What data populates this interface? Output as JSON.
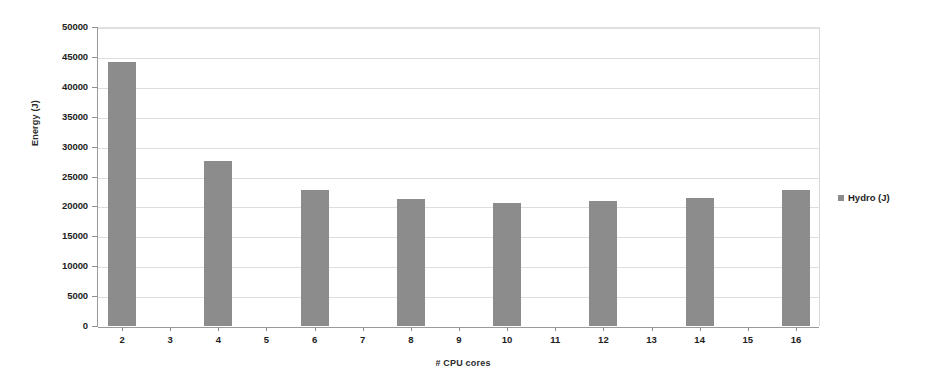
{
  "chart_data": {
    "type": "bar",
    "title": "",
    "xlabel": "# CPU cores",
    "ylabel": "Energy (J)",
    "categories": [
      "2",
      "3",
      "4",
      "5",
      "6",
      "7",
      "8",
      "9",
      "10",
      "11",
      "12",
      "13",
      "14",
      "15",
      "16"
    ],
    "values": [
      44200,
      null,
      27600,
      null,
      22700,
      null,
      21200,
      null,
      20500,
      null,
      20900,
      null,
      21400,
      null,
      22700
    ],
    "series": [
      {
        "name": "Hydro (J)",
        "color": "#8c8c8c",
        "values": [
          44200,
          null,
          27600,
          null,
          22700,
          null,
          21200,
          null,
          20500,
          null,
          20900,
          null,
          21400,
          null,
          22700
        ]
      }
    ],
    "ylim": [
      0,
      50000
    ],
    "ytick_labels": [
      "50000",
      "45000",
      "40000",
      "35000",
      "30000",
      "25000",
      "20000",
      "15000",
      "10000",
      "5000",
      "0"
    ],
    "ytick_values": [
      50000,
      45000,
      40000,
      35000,
      30000,
      25000,
      20000,
      15000,
      10000,
      5000,
      0
    ],
    "grid": true,
    "legend_position": "right",
    "legend": [
      {
        "label": "Hydro (J)",
        "color": "#8c8c8c"
      }
    ]
  }
}
